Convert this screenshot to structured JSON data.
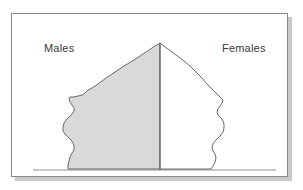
{
  "figure": {
    "type": "population-pyramid",
    "title": "",
    "background_color": "#ffffff",
    "frame": {
      "border_color": "#8a8a8a",
      "shadow_color": "#c9c9c9",
      "x": 11,
      "y": 13,
      "width": 277,
      "height": 164
    },
    "labels": {
      "males": "Males",
      "females": "Females"
    },
    "colors": {
      "male_fill": "#d9d9d9",
      "male_stroke": "#5a5a5a",
      "female_fill": "#ffffff",
      "female_stroke": "#5a5a5a",
      "center_axis": "#6e6e6e",
      "baseline": "#b5b5b5",
      "label_text": "#3b3b3b"
    },
    "geometry": {
      "center_x": 160,
      "apex_y": 43,
      "baseline_y": 170,
      "baseline_x_start": 33,
      "baseline_x_end": 276
    }
  },
  "chart_data": {
    "type": "area",
    "title": "",
    "subtitle": "",
    "xlabel": "",
    "ylabel": "",
    "grid": false,
    "legend_position": "inline-top",
    "axis_note": "Horizontal axis = population count, mirrored about the centre; vertical axis = age (youngest at bottom, oldest at top). No tick labels are printed on the figure.",
    "categories": [
      "0-4",
      "5-9",
      "10-14",
      "15-19",
      "20-24",
      "25-29",
      "30-34",
      "35-39",
      "40-44",
      "45-49",
      "50-54",
      "55-59",
      "60-64",
      "65-69",
      "70-74",
      "75-79",
      "80-84",
      "85+"
    ],
    "series": [
      {
        "name": "Males",
        "side": "left",
        "fill": "#d9d9d9",
        "values": [
          78,
          74,
          62,
          56,
          64,
          72,
          64,
          58,
          68,
          80,
          88,
          74,
          70,
          62,
          52,
          40,
          26,
          10
        ]
      },
      {
        "name": "Females",
        "side": "right",
        "fill": "#ffffff",
        "values": [
          82,
          80,
          66,
          58,
          66,
          74,
          62,
          56,
          64,
          76,
          84,
          70,
          66,
          58,
          50,
          38,
          24,
          9
        ]
      }
    ],
    "annotations": [
      {
        "text": "Males",
        "x": 58,
        "y": 48,
        "align": "left"
      },
      {
        "text": "Females",
        "x": 244,
        "y": 48,
        "align": "right"
      }
    ],
    "male_outline_points": "160,43 152,48 143,54 134,60 124,66 115,72 106,78 98,84 92,88 88,90 86,92 84,94 82,95 78,96 74,97 70,97 69,99 70,102 72,105 74,108 74,111 72,114 69,117 66,120 64,123 63,127 63,131 65,134 68,137 71,140 73,143 74,146 74,150 72,153 70,157 69,161 68,165 68,169 160,169",
    "female_outline_points": "160,43 168,49 176,55 184,61 191,67 197,73 202,78 206,83 210,87 213,90 215,92 217,94 219,96 221,98 223,100 222,103 220,106 218,109 217,112 218,115 221,118 223,121 224,124 224,128 223,132 221,135 218,138 215,141 213,144 212,147 213,151 215,154 216,158 215,162 213,166 211,169 160,169"
  }
}
